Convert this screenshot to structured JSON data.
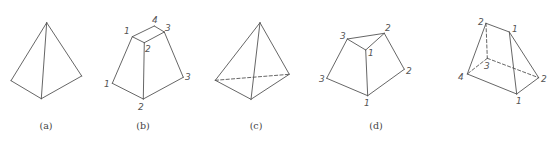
{
  "figures": [
    {
      "id": "a",
      "caption": "(a)",
      "caption_pos": [
        46,
        129
      ],
      "description": "triangular pyramid, visible edges only",
      "vertices": {
        "apex": [
          46.7,
          22.7
        ],
        "left": [
          11,
          80.7
        ],
        "bottom": [
          41.3,
          98.7
        ],
        "right": [
          81.7,
          76
        ]
      },
      "edges": [
        {
          "from": "apex",
          "to": "left",
          "hidden": false
        },
        {
          "from": "apex",
          "to": "bottom",
          "hidden": false
        },
        {
          "from": "apex",
          "to": "right",
          "hidden": false
        },
        {
          "from": "left",
          "to": "bottom",
          "hidden": false
        },
        {
          "from": "bottom",
          "to": "right",
          "hidden": false
        }
      ],
      "labels": []
    },
    {
      "id": "b",
      "caption": "(b)",
      "caption_pos": [
        143,
        129
      ],
      "description": "frustum with numbered vertices",
      "vertices": {
        "t1": [
          132.3,
          36.7
        ],
        "t4": [
          154.3,
          26
        ],
        "t3": [
          164.3,
          32
        ],
        "t2": [
          144.3,
          42.7
        ],
        "b1": [
          112.3,
          83.3
        ],
        "b2": [
          143.3,
          99
        ],
        "b3": [
          183.3,
          77.3
        ]
      },
      "edges": [
        {
          "from": "t1",
          "to": "t4",
          "hidden": false
        },
        {
          "from": "t4",
          "to": "t3",
          "hidden": false
        },
        {
          "from": "t3",
          "to": "t2",
          "hidden": false
        },
        {
          "from": "t2",
          "to": "t1",
          "hidden": false
        },
        {
          "from": "t1",
          "to": "b1",
          "hidden": false
        },
        {
          "from": "t2",
          "to": "b2",
          "hidden": false
        },
        {
          "from": "t3",
          "to": "b3",
          "hidden": false
        },
        {
          "from": "b1",
          "to": "b2",
          "hidden": false
        },
        {
          "from": "b2",
          "to": "b3",
          "hidden": false
        }
      ],
      "labels": [
        {
          "text": "1",
          "pos": [
            124,
            34
          ]
        },
        {
          "text": "4",
          "pos": [
            152,
            23
          ]
        },
        {
          "text": "3",
          "pos": [
            165,
            31
          ]
        },
        {
          "text": "2",
          "pos": [
            145,
            52
          ]
        },
        {
          "text": "1",
          "pos": [
            104,
            87
          ]
        },
        {
          "text": "2",
          "pos": [
            138,
            110
          ]
        },
        {
          "text": "3",
          "pos": [
            185,
            80
          ]
        }
      ]
    },
    {
      "id": "c",
      "caption": "(c)",
      "caption_pos": [
        256,
        129
      ],
      "description": "triangular pyramid with hidden base edge",
      "vertices": {
        "apex": [
          260,
          22.7
        ],
        "left": [
          215.3,
          80.3
        ],
        "bottom": [
          251,
          99.3
        ],
        "right": [
          289.3,
          74.3
        ]
      },
      "edges": [
        {
          "from": "apex",
          "to": "left",
          "hidden": false
        },
        {
          "from": "apex",
          "to": "bottom",
          "hidden": false
        },
        {
          "from": "apex",
          "to": "right",
          "hidden": false
        },
        {
          "from": "left",
          "to": "bottom",
          "hidden": false
        },
        {
          "from": "bottom",
          "to": "right",
          "hidden": false
        },
        {
          "from": "left",
          "to": "right",
          "hidden": true
        }
      ],
      "labels": []
    },
    {
      "id": "d",
      "caption": "(d)",
      "caption_pos": [
        376,
        129
      ],
      "description": "truncated pyramid with numbered vertices",
      "vertices": {
        "t3": [
          347.3,
          39
        ],
        "t2": [
          384.3,
          33.3
        ],
        "t1": [
          365.7,
          50
        ],
        "b3": [
          326.7,
          78.3
        ],
        "b1": [
          367.7,
          95.7
        ],
        "b2": [
          404.3,
          69.3
        ]
      },
      "edges": [
        {
          "from": "t3",
          "to": "t2",
          "hidden": false
        },
        {
          "from": "t2",
          "to": "t1",
          "hidden": false
        },
        {
          "from": "t1",
          "to": "t3",
          "hidden": false
        },
        {
          "from": "t3",
          "to": "b3",
          "hidden": false
        },
        {
          "from": "t1",
          "to": "b1",
          "hidden": false
        },
        {
          "from": "t2",
          "to": "b2",
          "hidden": false
        },
        {
          "from": "b3",
          "to": "b1",
          "hidden": false
        },
        {
          "from": "b1",
          "to": "b2",
          "hidden": false
        }
      ],
      "labels": [
        {
          "text": "3",
          "pos": [
            340,
            39
          ]
        },
        {
          "text": "2",
          "pos": [
            385,
            31
          ]
        },
        {
          "text": "1",
          "pos": [
            368,
            56
          ]
        },
        {
          "text": "3",
          "pos": [
            319,
            82
          ]
        },
        {
          "text": "1",
          "pos": [
            364,
            106
          ]
        },
        {
          "text": "2",
          "pos": [
            406,
            74
          ]
        }
      ]
    },
    {
      "id": "e",
      "caption": "",
      "caption_pos": [
        500,
        129
      ],
      "description": "wedge / truncated prism with hidden edges",
      "vertices": {
        "t2": [
          486,
          23.3
        ],
        "t1": [
          509.3,
          32
        ],
        "b4": [
          467.3,
          74
        ],
        "b3": [
          487.3,
          58.3
        ],
        "b1": [
          516.7,
          94
        ],
        "b2": [
          538.7,
          77.7
        ]
      },
      "edges": [
        {
          "from": "t2",
          "to": "t1",
          "hidden": false
        },
        {
          "from": "t2",
          "to": "b4",
          "hidden": false
        },
        {
          "from": "t1",
          "to": "b1",
          "hidden": false
        },
        {
          "from": "t1",
          "to": "b2",
          "hidden": false
        },
        {
          "from": "b4",
          "to": "b1",
          "hidden": false
        },
        {
          "from": "b1",
          "to": "b2",
          "hidden": false
        },
        {
          "from": "t2",
          "to": "b3",
          "hidden": true
        },
        {
          "from": "b3",
          "to": "b4",
          "hidden": true
        },
        {
          "from": "b3",
          "to": "b2",
          "hidden": true
        }
      ],
      "labels": [
        {
          "text": "2",
          "pos": [
            478,
            25
          ]
        },
        {
          "text": "1",
          "pos": [
            512,
            32
          ]
        },
        {
          "text": "4",
          "pos": [
            458,
            80
          ]
        },
        {
          "text": "3",
          "pos": [
            484,
            69
          ]
        },
        {
          "text": "1",
          "pos": [
            516,
            104
          ]
        },
        {
          "text": "2",
          "pos": [
            541,
            82
          ]
        }
      ]
    }
  ]
}
